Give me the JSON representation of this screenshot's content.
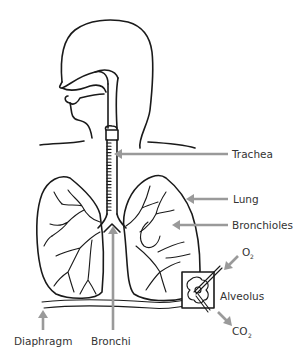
{
  "diagram": {
    "labels": {
      "trachea": "Trachea",
      "lung": "Lung",
      "bronchioles": "Bronchioles",
      "o2": "O",
      "o2_sub": "2",
      "alveolus": "Alveolus",
      "co2": "CO",
      "co2_sub": "2",
      "diaphragm": "Diaphragm",
      "bronchi": "Bronchi"
    },
    "colors": {
      "ink": "#1a1a1a",
      "arrow": "#9a9a9a",
      "label": "#333333",
      "background": "#ffffff"
    }
  }
}
